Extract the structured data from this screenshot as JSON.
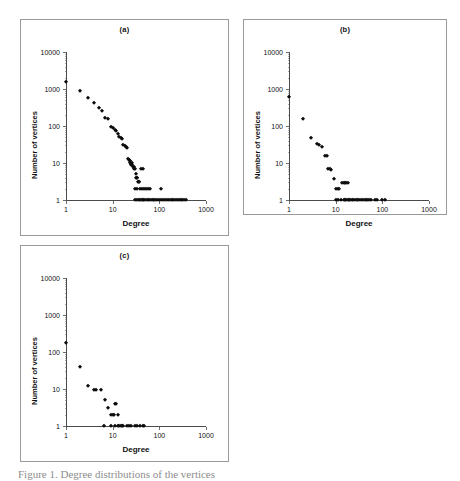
{
  "figure": {
    "caption": "Figure 1.   Degree distributions of the vertices",
    "marker_color": "#0d0d0d",
    "axis_color": "#4b4b4b",
    "panel_border_color": "#9a9a9a"
  },
  "panels": [
    {
      "id": "a",
      "title": "(a)",
      "chart_data": {
        "type": "scatter",
        "title": "(a)",
        "xlabel": "Degree",
        "ylabel": "Number of vertices",
        "xscale": "log",
        "yscale": "log",
        "xlim": [
          1,
          1000
        ],
        "ylim": [
          1,
          10000
        ],
        "xticks": [
          1,
          10,
          100,
          1000
        ],
        "xtick_labels": [
          "1",
          "10",
          "100",
          "1000"
        ],
        "yticks": [
          1,
          10,
          100,
          1000,
          10000
        ],
        "ytick_labels": [
          "1",
          "10",
          "100",
          "1000",
          "10000"
        ],
        "grid": false,
        "legend": false,
        "points": [
          [
            1,
            1500
          ],
          [
            2,
            900
          ],
          [
            3,
            580
          ],
          [
            4,
            420
          ],
          [
            5,
            310
          ],
          [
            6,
            250
          ],
          [
            7,
            160
          ],
          [
            8,
            150
          ],
          [
            9,
            95
          ],
          [
            10,
            90
          ],
          [
            11,
            80
          ],
          [
            12,
            72
          ],
          [
            13,
            60
          ],
          [
            14,
            52
          ],
          [
            15,
            48
          ],
          [
            16,
            44
          ],
          [
            17,
            30
          ],
          [
            18,
            28
          ],
          [
            19,
            27
          ],
          [
            20,
            26
          ],
          [
            21,
            13
          ],
          [
            22,
            12
          ],
          [
            23,
            11
          ],
          [
            24,
            10
          ],
          [
            25,
            9
          ],
          [
            26,
            9
          ],
          [
            27,
            8
          ],
          [
            28,
            8
          ],
          [
            29,
            7
          ],
          [
            30,
            7
          ],
          [
            31,
            5
          ],
          [
            32,
            4
          ],
          [
            33,
            4
          ],
          [
            34,
            4
          ],
          [
            35,
            3
          ],
          [
            36,
            3
          ],
          [
            37,
            3
          ],
          [
            26,
            10
          ],
          [
            24,
            11
          ],
          [
            40,
            7
          ],
          [
            45,
            7
          ],
          [
            30,
            2
          ],
          [
            34,
            2
          ],
          [
            38,
            2
          ],
          [
            42,
            2
          ],
          [
            46,
            2
          ],
          [
            52,
            2
          ],
          [
            58,
            2
          ],
          [
            64,
            2
          ],
          [
            110,
            2
          ],
          [
            30,
            1
          ],
          [
            33,
            1
          ],
          [
            36,
            1
          ],
          [
            39,
            1
          ],
          [
            42,
            1
          ],
          [
            45,
            1
          ],
          [
            48,
            1
          ],
          [
            52,
            1
          ],
          [
            56,
            1
          ],
          [
            60,
            1
          ],
          [
            66,
            1
          ],
          [
            72,
            1
          ],
          [
            78,
            1
          ],
          [
            85,
            1
          ],
          [
            95,
            1
          ],
          [
            105,
            1
          ],
          [
            115,
            1
          ],
          [
            128,
            1
          ],
          [
            140,
            1
          ],
          [
            155,
            1
          ],
          [
            170,
            1
          ],
          [
            185,
            1
          ],
          [
            200,
            1
          ],
          [
            220,
            1
          ],
          [
            240,
            1
          ],
          [
            260,
            1
          ],
          [
            285,
            1
          ],
          [
            310,
            1
          ],
          [
            340,
            1
          ],
          [
            380,
            1
          ]
        ]
      }
    },
    {
      "id": "b",
      "title": "(b)",
      "chart_data": {
        "type": "scatter",
        "title": "(b)",
        "xlabel": "Degree",
        "ylabel": "Number of vertices",
        "xscale": "log",
        "yscale": "log",
        "xlim": [
          1,
          1000
        ],
        "ylim": [
          1,
          10000
        ],
        "xticks": [
          1,
          10,
          100,
          1000
        ],
        "xtick_labels": [
          "1",
          "10",
          "100",
          "1000"
        ],
        "yticks": [
          1,
          10,
          100,
          1000,
          10000
        ],
        "ytick_labels": [
          "1",
          "10",
          "100",
          "1000",
          "10000"
        ],
        "grid": false,
        "legend": false,
        "points": [
          [
            1,
            620
          ],
          [
            2,
            150
          ],
          [
            3,
            48
          ],
          [
            4,
            33
          ],
          [
            4.5,
            31
          ],
          [
            5,
            27
          ],
          [
            6,
            15
          ],
          [
            6.5,
            15
          ],
          [
            7,
            7
          ],
          [
            7.5,
            7
          ],
          [
            8,
            6.5
          ],
          [
            9,
            3.6
          ],
          [
            10,
            2
          ],
          [
            11,
            2
          ],
          [
            12,
            2
          ],
          [
            14,
            2.8
          ],
          [
            15,
            2.8
          ],
          [
            16,
            2.8
          ],
          [
            17,
            2.8
          ],
          [
            18,
            2.8
          ],
          [
            10,
            1
          ],
          [
            11,
            1
          ],
          [
            13,
            1
          ],
          [
            15,
            1
          ],
          [
            16,
            1
          ],
          [
            17,
            1
          ],
          [
            18,
            1
          ],
          [
            19,
            1
          ],
          [
            20,
            1
          ],
          [
            22,
            1
          ],
          [
            24,
            1
          ],
          [
            26,
            1
          ],
          [
            28,
            1
          ],
          [
            30,
            1
          ],
          [
            33,
            1
          ],
          [
            36,
            1
          ],
          [
            40,
            1
          ],
          [
            44,
            1
          ],
          [
            48,
            1
          ],
          [
            53,
            1
          ],
          [
            58,
            1
          ],
          [
            70,
            1
          ],
          [
            78,
            1
          ],
          [
            100,
            1
          ],
          [
            112,
            1
          ]
        ]
      }
    },
    {
      "id": "c",
      "title": "(c)",
      "chart_data": {
        "type": "scatter",
        "title": "(c)",
        "xlabel": "Degree",
        "ylabel": "Number of vertices",
        "xscale": "log",
        "yscale": "log",
        "xlim": [
          1,
          1000
        ],
        "ylim": [
          1,
          10000
        ],
        "xticks": [
          1,
          10,
          100,
          1000
        ],
        "xtick_labels": [
          "1",
          "10",
          "100",
          "1000"
        ],
        "yticks": [
          1,
          10,
          100,
          1000,
          10000
        ],
        "ytick_labels": [
          "1",
          "10",
          "100",
          "1000",
          "10000"
        ],
        "grid": false,
        "legend": false,
        "points": [
          [
            1,
            180
          ],
          [
            2,
            40
          ],
          [
            3,
            12
          ],
          [
            4,
            9.5
          ],
          [
            4.4,
            9.5
          ],
          [
            5.5,
            9.5
          ],
          [
            7,
            5
          ],
          [
            8,
            3
          ],
          [
            9,
            2
          ],
          [
            10,
            2
          ],
          [
            10.5,
            2
          ],
          [
            11,
            4
          ],
          [
            12,
            4
          ],
          [
            13,
            2
          ],
          [
            6.5,
            1
          ],
          [
            9,
            1
          ],
          [
            11,
            1
          ],
          [
            13,
            1
          ],
          [
            14,
            1
          ],
          [
            15,
            1
          ],
          [
            16,
            1
          ],
          [
            17,
            1
          ],
          [
            20,
            1
          ],
          [
            22,
            1
          ],
          [
            25,
            1
          ],
          [
            30,
            1
          ],
          [
            34,
            1
          ],
          [
            38,
            1
          ],
          [
            44,
            1
          ],
          [
            48,
            1
          ]
        ]
      }
    }
  ]
}
